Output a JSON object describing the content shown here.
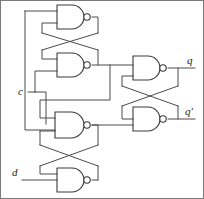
{
  "diagram": {
    "type": "logic-circuit-schematic",
    "background_color": "#ffffff",
    "wire_color": "#4a4a4a",
    "gate_outline_color": "#3a3a3a",
    "label_color": "#1a1a1a",
    "width": 204,
    "height": 199
  },
  "inputs": [
    {
      "id": "c",
      "label": "c",
      "x": 20,
      "y": 92
    },
    {
      "id": "d",
      "label": "d",
      "x": 14,
      "y": 172
    }
  ],
  "outputs": [
    {
      "id": "q",
      "label": "q",
      "x": 188,
      "y": 66
    },
    {
      "id": "qprime",
      "label": "q′",
      "x": 186,
      "y": 116
    }
  ],
  "gates": [
    {
      "id": "nand1",
      "type": "NAND",
      "inputs": 2,
      "x": 57,
      "y": 5,
      "w": 30,
      "h": 24
    },
    {
      "id": "nand2",
      "type": "NAND",
      "inputs": 2,
      "x": 57,
      "y": 53,
      "w": 30,
      "h": 24
    },
    {
      "id": "nand3",
      "type": "NAND",
      "inputs": 3,
      "x": 55,
      "y": 112,
      "w": 32,
      "h": 26
    },
    {
      "id": "nand4",
      "type": "NAND",
      "inputs": 2,
      "x": 57,
      "y": 168,
      "w": 30,
      "h": 24
    },
    {
      "id": "nand5",
      "type": "NAND",
      "inputs": 2,
      "x": 133,
      "y": 56,
      "w": 30,
      "h": 24
    },
    {
      "id": "nand6",
      "type": "NAND",
      "inputs": 2,
      "x": 133,
      "y": 107,
      "w": 30,
      "h": 24
    }
  ],
  "labels": {
    "clock": "c",
    "data": "d",
    "q": "q",
    "q_not": "q′"
  }
}
